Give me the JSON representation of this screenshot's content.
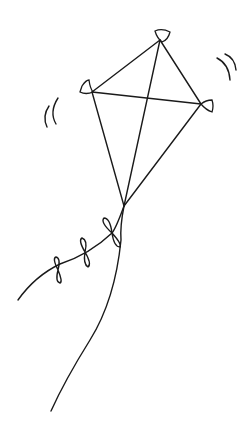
{
  "illustration": {
    "subject": "kite line drawing",
    "alt": "Hand-drawn kite with cross spars, bow-tie tail, string, and motion marks",
    "colors": {
      "stroke": "#1a1a1a",
      "background": "#ffffff"
    }
  }
}
